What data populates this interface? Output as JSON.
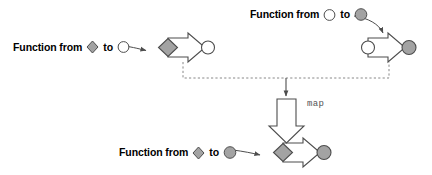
{
  "diagram": {
    "palette": {
      "background": "#ffffff",
      "shape_fill_gray": "#a3a3a3",
      "shape_fill_white": "#ffffff",
      "outline": "#4d4d4d",
      "text": "#000000",
      "map_label_color": "#555555",
      "dashed_line": "#777777"
    },
    "nodes": [
      {
        "id": "source-function-left",
        "label_parts": {
          "prefix": "Function from",
          "from_shape": "diamond-gray",
          "middle": "to",
          "to_shape": "circle-white"
        },
        "glyph": {
          "left_shape": "diamond-gray",
          "body": "block-arrow-right-white",
          "right_shape": "circle-white"
        }
      },
      {
        "id": "source-function-right",
        "label_parts": {
          "prefix": "Function from",
          "from_shape": "circle-white",
          "middle": "to",
          "to_shape": "circle-gray"
        },
        "glyph": {
          "left_shape": "circle-white",
          "body": "block-arrow-right-white",
          "right_shape": "circle-gray"
        }
      },
      {
        "id": "result-function",
        "label_parts": {
          "prefix": "Function from",
          "from_shape": "diamond-gray",
          "middle": "to",
          "to_shape": "circle-gray"
        },
        "glyph": {
          "left_shape": "diamond-gray",
          "body": "block-arrow-right-white",
          "right_shape": "circle-gray"
        }
      }
    ],
    "operator": {
      "id": "map-operator",
      "label": "map",
      "glyph": "block-arrow-down-white"
    },
    "connectors": [
      {
        "id": "label-to-glyph-left",
        "style": "solid-curved-arrow"
      },
      {
        "id": "label-to-glyph-right",
        "style": "solid-curved-arrow"
      },
      {
        "id": "label-to-glyph-bottom",
        "style": "solid-curved-arrow"
      },
      {
        "id": "inputs-join-dashed",
        "style": "dashed-bus"
      },
      {
        "id": "join-to-map",
        "style": "solid-arrow-down"
      }
    ]
  },
  "labels": {
    "left": {
      "prefix": "Function from",
      "middle": "to"
    },
    "right": {
      "prefix": "Function from",
      "middle": "to"
    },
    "bottom": {
      "prefix": "Function from",
      "middle": "to"
    },
    "map": "map"
  }
}
